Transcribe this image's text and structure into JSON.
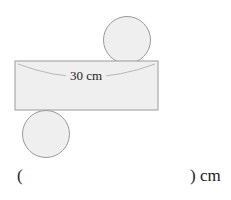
{
  "diagram": {
    "type": "cylinder-net",
    "label": "30 cm",
    "colors": {
      "fill": "#efefef",
      "stroke": "#9a9a9a",
      "arc": "#b8b8b8"
    }
  },
  "answer": {
    "open": "(",
    "close": ") cm"
  }
}
